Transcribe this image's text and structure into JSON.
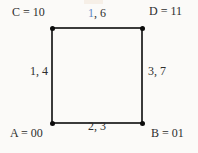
{
  "figure": {
    "type": "graph-diagram",
    "description_visible_text_only": true,
    "colors": {
      "background": "#fbfaf8",
      "edge_line": "#3b3b3b",
      "vertex_dot": "#0c0c0c",
      "text": "#2e2e2e",
      "highlight_blue": "#5d86c3"
    },
    "vertices": [
      {
        "id": "C",
        "position": "top-left",
        "label": "C = 10"
      },
      {
        "id": "D",
        "position": "top-right",
        "label": "D = 11"
      },
      {
        "id": "A",
        "position": "bottom-left",
        "label": "A = 00"
      },
      {
        "id": "B",
        "position": "bottom-right",
        "label": "B = 01"
      }
    ],
    "edges": [
      {
        "side": "top",
        "label_highlight": "1",
        "label_rest": ", 6"
      },
      {
        "side": "left",
        "label": "1, 4"
      },
      {
        "side": "right",
        "label": "3, 7"
      },
      {
        "side": "bottom",
        "label": "2, 3"
      }
    ]
  }
}
